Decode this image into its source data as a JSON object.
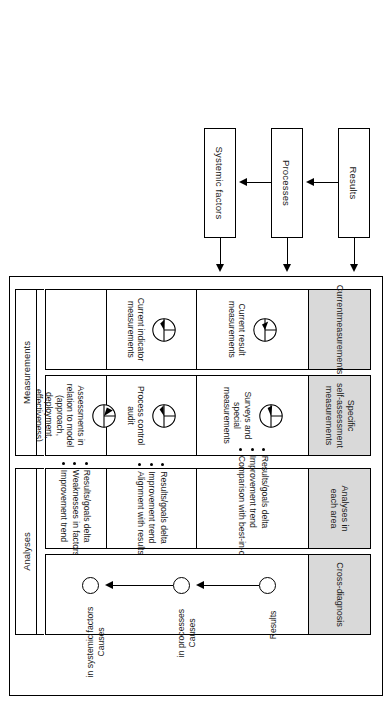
{
  "flow": {
    "items": [
      {
        "label": "Results"
      },
      {
        "label": "Processes"
      },
      {
        "label": "Systemic factors"
      }
    ]
  },
  "matrix": {
    "columns": [
      {
        "id": "current-measurements",
        "header": "Current\nmeasurements",
        "header_lines": [
          "Current",
          "measurements"
        ],
        "cells": [
          {
            "icon": "gauge-icon",
            "text": "Current result measurements"
          },
          {
            "icon": "gauge-icon",
            "text": "Current indicator measurements"
          },
          {
            "icon": "",
            "text": ""
          }
        ]
      },
      {
        "id": "specific-self-assessment-measurements",
        "header_lines": [
          "Specific",
          "self-assessment",
          "measurements"
        ],
        "cells": [
          {
            "icon": "gauge-icon",
            "text": "Surveys and special measurements"
          },
          {
            "icon": "gauge-icon",
            "text": "Process control audit"
          },
          {
            "icon": "gauge-icon",
            "text": "Assessments in relation to model (approach, deployment, effectiveness)"
          }
        ]
      },
      {
        "id": "analyses-in-each-area",
        "header_lines": [
          "Analyses in",
          "each area"
        ],
        "cells": [
          {
            "bullets": [
              "Results/goals delta",
              "Improvement trend",
              "Comparison with best-in-class"
            ]
          },
          {
            "bullets": [
              "Results/goals delta",
              "Improvement trend",
              "Alignment with results"
            ]
          },
          {
            "bullets": [
              "Results/goals delta",
              "Weaknesses in factors",
              "Improvement trend"
            ]
          }
        ]
      },
      {
        "id": "cross-diagnosis",
        "header_lines": [
          "Cross-diagnosis"
        ],
        "nodes": [
          {
            "label_lines": [
              "Results"
            ]
          },
          {
            "label_lines": [
              "Causes",
              "in processes"
            ]
          },
          {
            "label_lines": [
              "Causes",
              "in systemic factors"
            ]
          }
        ]
      }
    ]
  },
  "groups": [
    {
      "label": "Measurements"
    },
    {
      "label": "Analyses"
    }
  ],
  "colors": {
    "header_fill": "#d9d9d9",
    "stroke": "#000000",
    "background": "#ffffff"
  }
}
